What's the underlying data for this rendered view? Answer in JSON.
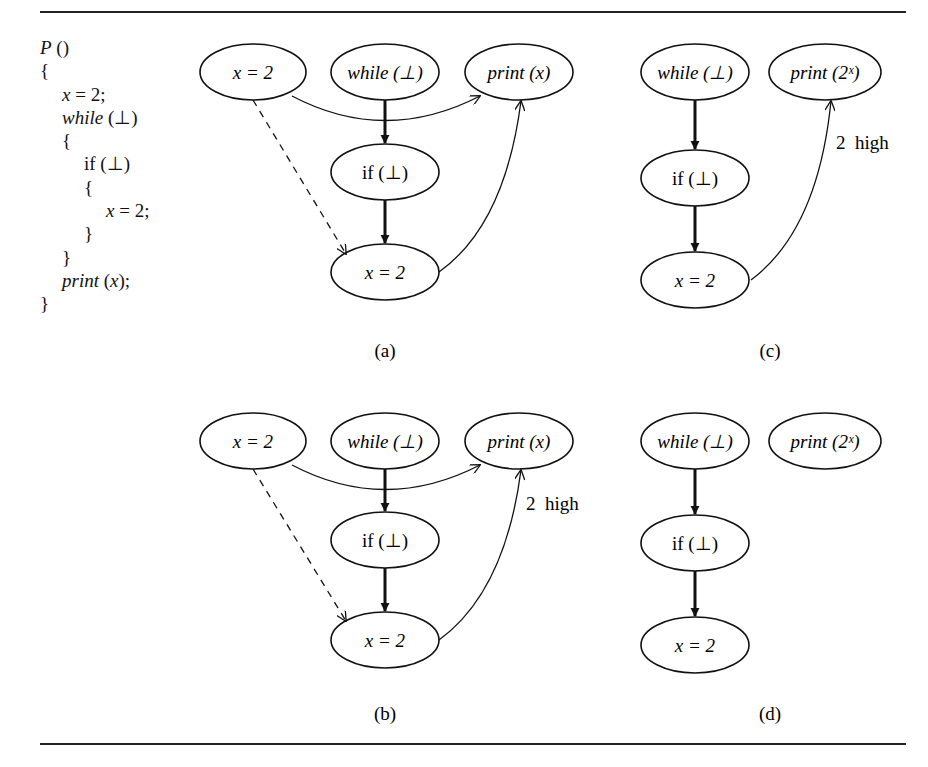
{
  "figure": {
    "code": {
      "lines": [
        {
          "indent": 0,
          "parts": [
            {
              "t": "P",
              "i": true
            },
            {
              "t": " ()",
              "i": false
            }
          ]
        },
        {
          "indent": 0,
          "parts": [
            {
              "t": "{",
              "i": false
            }
          ]
        },
        {
          "indent": 1,
          "parts": [
            {
              "t": "x",
              "i": true
            },
            {
              "t": " = 2;",
              "i": false
            }
          ]
        },
        {
          "indent": 1,
          "parts": [
            {
              "t": "while",
              "i": true
            },
            {
              "t": " (⊥)",
              "i": false
            }
          ]
        },
        {
          "indent": 1,
          "parts": [
            {
              "t": "{",
              "i": false
            }
          ]
        },
        {
          "indent": 2,
          "parts": [
            {
              "t": "if (⊥)",
              "i": false
            }
          ]
        },
        {
          "indent": 2,
          "parts": [
            {
              "t": "{",
              "i": false
            }
          ]
        },
        {
          "indent": 3,
          "parts": [
            {
              "t": "x",
              "i": true
            },
            {
              "t": " = 2;",
              "i": false
            }
          ]
        },
        {
          "indent": 2,
          "parts": [
            {
              "t": "}",
              "i": false
            }
          ]
        },
        {
          "indent": 1,
          "parts": [
            {
              "t": "}",
              "i": false
            }
          ]
        },
        {
          "indent": 1,
          "parts": [
            {
              "t": "print",
              "i": true
            },
            {
              "t": " (",
              "i": false
            },
            {
              "t": "x",
              "i": true
            },
            {
              "t": ");",
              "i": false
            }
          ]
        },
        {
          "indent": 0,
          "parts": [
            {
              "t": "}",
              "i": false
            }
          ]
        }
      ]
    },
    "node_labels": {
      "assign": "x = 2",
      "while": "while (⊥)",
      "if": "if (⊥)",
      "print_x": "print (x)",
      "print_2x": "print (2ˣ)"
    },
    "edge_labels": {
      "high": "2  high"
    },
    "panels": [
      {
        "id": "a",
        "label": "(a)"
      },
      {
        "id": "b",
        "label": "(b)"
      },
      {
        "id": "c",
        "label": "(c)"
      },
      {
        "id": "d",
        "label": "(d)"
      }
    ]
  }
}
